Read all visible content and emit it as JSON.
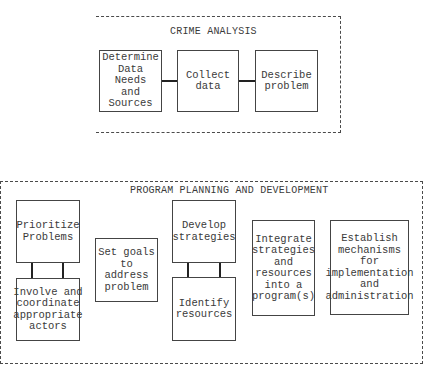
{
  "crime_analysis": {
    "title": "CRIME ANALYSIS",
    "steps": [
      {
        "label": "Determine\nData Needs\nand\nSources"
      },
      {
        "label": "Collect\ndata"
      },
      {
        "label": "Describe\nproblem"
      }
    ]
  },
  "program_planning": {
    "title": "PROGRAM PLANNING AND DEVELOPMENT",
    "steps": [
      {
        "label": "Prioritize\nProblems"
      },
      {
        "label": "Involve and\ncoordinate\nappropriate\nactors"
      },
      {
        "label": "Set goals\nto address\nproblem"
      },
      {
        "label": "Develop\nstrategies"
      },
      {
        "label": "Identify\nresources"
      },
      {
        "label": "Integrate\nstrategies\nand\nresources\ninto a\nprogram(s)"
      },
      {
        "label": "Establish\nmechanisms\nfor\nimplementation\nand\nadministration"
      }
    ]
  }
}
